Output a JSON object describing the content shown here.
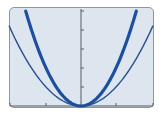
{
  "chart_data": {
    "type": "line",
    "title": "",
    "xlabel": "",
    "ylabel": "",
    "xlim": [
      -2,
      2
    ],
    "ylim": [
      0,
      5
    ],
    "x_ticks": [
      -1,
      0,
      1
    ],
    "y_ticks": [
      1,
      2,
      3,
      4,
      5
    ],
    "grid": false,
    "legend": null,
    "series": [
      {
        "name": "y = x^2",
        "style": "thin",
        "color": "#2a4f8f",
        "x": [
          -2,
          -1,
          0,
          1,
          2
        ],
        "values": [
          4,
          1,
          0,
          1,
          4
        ]
      },
      {
        "name": "y = 2x^2",
        "style": "thick",
        "color": "#1d4fa0",
        "x": [
          -1.58,
          -1,
          0,
          1,
          1.58
        ],
        "values": [
          5,
          2,
          0,
          2,
          5
        ]
      }
    ]
  },
  "colors": {
    "screen_bg": "#dde6ef",
    "frame": "#8f969c",
    "axis": "#555b62",
    "thin_curve": "#2a4f8f",
    "thick_curve": "#1d4fa0"
  }
}
